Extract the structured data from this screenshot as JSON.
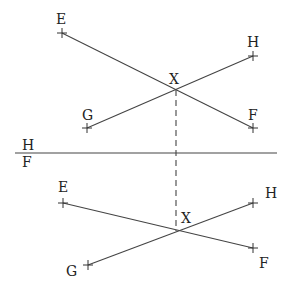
{
  "diagram": {
    "type": "descriptive-geometry two-view projection of intersecting lines",
    "colors": {
      "line": "#444444",
      "text": "#222222",
      "background": "#ffffff"
    },
    "ground_line": {
      "x1": 15,
      "y1": 153,
      "x2": 277,
      "y2": 153,
      "label_above": "H",
      "label_below": "F",
      "label_above_pos": [
        22,
        150
      ],
      "label_below_pos": [
        22,
        167
      ]
    },
    "top_view": {
      "points": {
        "E": {
          "label": "E",
          "x": 62,
          "y": 33,
          "lx": 56,
          "ly": 24
        },
        "F": {
          "label": "F",
          "x": 253,
          "y": 128,
          "lx": 248,
          "ly": 120
        },
        "G": {
          "label": "G",
          "x": 87,
          "y": 128,
          "lx": 82,
          "ly": 120
        },
        "H": {
          "label": "H",
          "x": 253,
          "y": 56,
          "lx": 247,
          "ly": 47
        },
        "X": {
          "label": "X",
          "x": 176,
          "y": 90,
          "lx": 169,
          "ly": 84
        }
      },
      "lines": [
        [
          "E",
          "F"
        ],
        [
          "G",
          "H"
        ]
      ]
    },
    "front_view": {
      "points": {
        "E": {
          "label": "E",
          "x": 63,
          "y": 203,
          "lx": 58,
          "ly": 192
        },
        "F": {
          "label": "F",
          "x": 253,
          "y": 248,
          "lx": 259,
          "ly": 268
        },
        "G": {
          "label": "G",
          "x": 88,
          "y": 265,
          "lx": 66,
          "ly": 276
        },
        "H": {
          "label": "H",
          "x": 253,
          "y": 203,
          "lx": 265,
          "ly": 198
        },
        "X": {
          "label": "X",
          "x": 176,
          "y": 231,
          "lx": 181,
          "ly": 223
        }
      },
      "lines": [
        [
          "E",
          "F"
        ],
        [
          "G",
          "H"
        ]
      ]
    },
    "projector": {
      "x": 176,
      "y1": 90,
      "y2": 231,
      "style": "dashed"
    }
  }
}
